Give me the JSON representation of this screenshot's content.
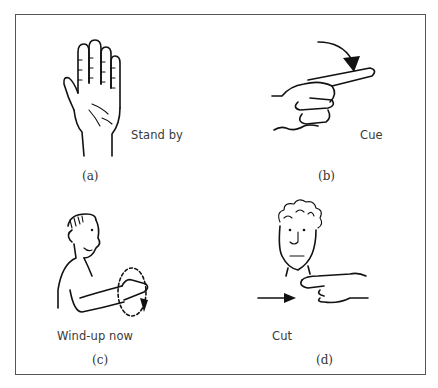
{
  "figure": {
    "panels": [
      {
        "id": "a",
        "caption": "(a)",
        "signal_label": "Stand by",
        "illustration": "open-raised-palm-hand"
      },
      {
        "id": "b",
        "caption": "(b)",
        "signal_label": "Cue",
        "illustration": "pointing-finger-with-downward-arrow"
      },
      {
        "id": "c",
        "caption": "(c)",
        "signal_label": "Wind-up now",
        "illustration": "man-rotating-hand-in-circle"
      },
      {
        "id": "d",
        "caption": "(d)",
        "signal_label": "Cut",
        "illustration": "man-slicing-finger-across-throat"
      }
    ],
    "colors": {
      "frame": "#555555",
      "ink": "#111111",
      "text": "#333333",
      "background": "#ffffff"
    }
  }
}
